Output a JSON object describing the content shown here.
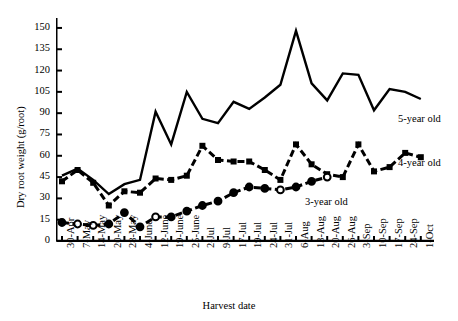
{
  "chart_data": {
    "type": "line",
    "title": "",
    "xlabel": "Harvest date",
    "ylabel": "Dry root weight (g/root)",
    "ylim": [
      0,
      157
    ],
    "yticks": [
      0,
      15,
      30,
      45,
      60,
      75,
      90,
      105,
      120,
      135,
      150
    ],
    "grid": false,
    "legend_position": "inline-right",
    "categories": [
      "30-Apr",
      "7-May",
      "14-May",
      "20-May",
      "28-May",
      "4-June",
      "12-June",
      "19-June",
      "25-June",
      "2-Jul",
      "9-Jul",
      "17-Jul",
      "19-Jul",
      "24-Jul",
      "31-Jul",
      "6-Aug",
      "13-Aug",
      "20-Aug",
      "26-Aug",
      "3-Sep",
      "10-Sep",
      "17-Sep",
      "24-Sep",
      "1-Oct"
    ],
    "series": [
      {
        "name": "5-year old",
        "marker": "none",
        "linestyle": "solid",
        "color": "#000000",
        "values": [
          46,
          51,
          43,
          33,
          40,
          43,
          91,
          68,
          105,
          86,
          83,
          98,
          93,
          101,
          110,
          148,
          111,
          99,
          118,
          117,
          92,
          107,
          105,
          100
        ]
      },
      {
        "name": "4-year old",
        "marker": "square",
        "linestyle": "dashed",
        "color": "#000000",
        "values": [
          42,
          50,
          41,
          25,
          35,
          34,
          44,
          43,
          46,
          67,
          57,
          56,
          56,
          50,
          43,
          68,
          54,
          47,
          45,
          68,
          49,
          52,
          62,
          59
        ]
      },
      {
        "name": "3-year old",
        "marker": "circle",
        "linestyle": "dashed",
        "color": "#000000",
        "values": [
          13,
          12,
          11,
          12,
          20,
          10,
          17,
          17,
          21,
          25,
          28,
          34,
          38,
          37,
          36,
          38,
          42,
          45,
          null,
          null,
          null,
          null,
          null,
          null
        ],
        "marker_fill": [
          "filled",
          "open",
          "open",
          "filled",
          "filled",
          "filled",
          "open",
          "filled",
          "filled",
          "filled",
          "filled",
          "filled",
          "filled",
          "filled",
          "open",
          "filled",
          "filled",
          "open"
        ]
      }
    ],
    "series_labels": [
      {
        "text": "5-year old",
        "x": 398,
        "y": 113
      },
      {
        "text": "4-year old",
        "x": 398,
        "y": 157
      },
      {
        "text": "3-year old",
        "x": 305,
        "y": 196
      }
    ]
  }
}
